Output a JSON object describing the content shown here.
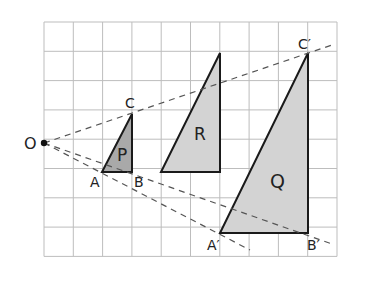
{
  "grid": {
    "left": 44,
    "top": 22,
    "cell": 29.3,
    "cols": 10,
    "rows": 8,
    "line_color": "#bdbdbd"
  },
  "center": {
    "label": "O",
    "x": 44,
    "y": 143
  },
  "triangles": {
    "P": {
      "label": "P",
      "fill": "#a9a9a9",
      "points": [
        [
          102,
          172
        ],
        [
          132,
          172
        ],
        [
          132,
          114
        ]
      ]
    },
    "R": {
      "label": "R",
      "fill": "#d3d3d3",
      "points": [
        [
          161,
          172
        ],
        [
          220,
          172
        ],
        [
          220,
          53
        ]
      ]
    },
    "Q": {
      "label": "Q",
      "fill": "#d3d3d3",
      "points": [
        [
          220,
          233
        ],
        [
          308,
          233
        ],
        [
          308,
          53
        ]
      ]
    }
  },
  "labels": {
    "O": "O",
    "A": "A",
    "B": "B",
    "C": "C",
    "A_prime": "A′",
    "B_prime": "B′",
    "C_prime": "C′",
    "P": "P",
    "R": "R",
    "Q": "Q"
  },
  "rays": [
    {
      "name": "ray-o-c",
      "to": [
        332,
        45
      ]
    },
    {
      "name": "ray-o-a",
      "to": [
        250,
        250
      ]
    },
    {
      "name": "ray-o-b",
      "to": [
        332,
        244
      ]
    }
  ]
}
